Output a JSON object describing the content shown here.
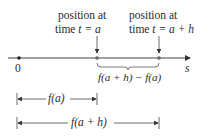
{
  "diagram": {
    "type": "number-line-displacement",
    "axis_label": "s",
    "origin_label": "0",
    "point_a": {
      "caption_line1": "position at",
      "caption_line2_prefix": "time ",
      "caption_line2_var": "t = a"
    },
    "point_a_plus_h": {
      "caption_line1": "position at",
      "caption_line2_prefix": "time ",
      "caption_line2_var": "t = a + h"
    },
    "brace_label": "f(a + h) − f(a)",
    "measure_fa_label": "f(a)",
    "measure_fah_label": "f(a + h)"
  },
  "colors": {
    "line": "#444444",
    "points": "#555555",
    "text": "#2a2a2a"
  }
}
